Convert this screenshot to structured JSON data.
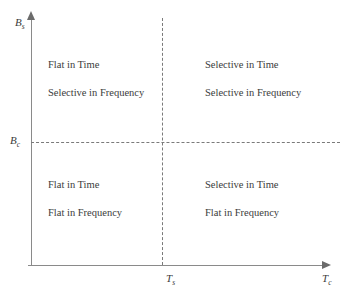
{
  "chart_data": {
    "type": "diagram",
    "title": "",
    "xlabel": "T_c",
    "ylabel": "B_s",
    "axes": {
      "x": {
        "symbol": "T",
        "subscript": "c",
        "arrow": "right"
      },
      "y": {
        "symbol": "B",
        "subscript": "s",
        "arrow": "up"
      }
    },
    "thresholds": [
      {
        "name": "x-threshold",
        "symbol": "T",
        "subscript": "s",
        "orientation": "vertical",
        "style": "dashed"
      },
      {
        "name": "y-threshold",
        "symbol": "B",
        "subscript": "c",
        "orientation": "horizontal",
        "style": "dashed"
      }
    ],
    "quadrants": [
      {
        "position": "top-left",
        "line1": "Flat in Time",
        "line2": "Selective in Frequency"
      },
      {
        "position": "top-right",
        "line1": "Selective in Time",
        "line2": "Selective in Frequency"
      },
      {
        "position": "bottom-left",
        "line1": "Flat in Time",
        "line2": "Flat in Frequency"
      },
      {
        "position": "bottom-right",
        "line1": "Selective in Time",
        "line2": "Flat in Frequency"
      }
    ]
  },
  "axis_labels": {
    "y_symbol": "B",
    "y_subscript": "s",
    "y_tick_symbol": "B",
    "y_tick_subscript": "c",
    "x_symbol": "T",
    "x_subscript": "c",
    "x_tick_symbol": "T",
    "x_tick_subscript": "s"
  },
  "quadrant_tl": {
    "line1": "Flat in Time",
    "line2": "Selective in Frequency"
  },
  "quadrant_tr": {
    "line1": "Selective in Time",
    "line2": "Selective in Frequency"
  },
  "quadrant_bl": {
    "line1": "Flat in Time",
    "line2": "Flat in Frequency"
  },
  "quadrant_br": {
    "line1": "Selective in Time",
    "line2": "Flat in Frequency"
  },
  "colors": {
    "background": "#ffffff",
    "text": "#3b3b3b",
    "axis_line": "#8a8a8a",
    "dashed_line": "#7a7a7a"
  }
}
